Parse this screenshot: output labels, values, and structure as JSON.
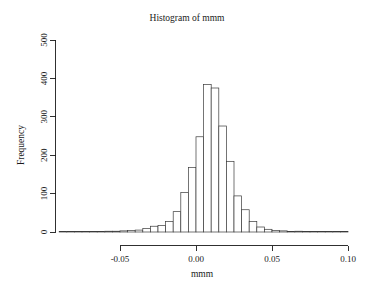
{
  "chart_data": {
    "type": "bar",
    "subtype": "histogram",
    "title": "Histogram of mmm",
    "xlabel": "mmm",
    "ylabel": "Frequency",
    "xlim": [
      -0.09,
      0.101
    ],
    "ylim": [
      0,
      500
    ],
    "grid": false,
    "legend": null,
    "bin_width": 0.005,
    "xticks": [
      -0.05,
      0.0,
      0.05,
      0.1
    ],
    "xticklabels": [
      "-0.05",
      "0.00",
      "0.05",
      "0.10"
    ],
    "yticks": [
      0,
      100,
      200,
      300,
      400,
      500
    ],
    "yticklabels": [
      "0",
      "100",
      "200",
      "300",
      "400",
      "500"
    ],
    "bin_starts": [
      -0.09,
      -0.085,
      -0.08,
      -0.075,
      -0.07,
      -0.065,
      -0.06,
      -0.055,
      -0.05,
      -0.045,
      -0.04,
      -0.035,
      -0.03,
      -0.025,
      -0.02,
      -0.015,
      -0.01,
      -0.005,
      0.0,
      0.005,
      0.01,
      0.015,
      0.02,
      0.025,
      0.03,
      0.035,
      0.04,
      0.045,
      0.05,
      0.055,
      0.06,
      0.065,
      0.07,
      0.075,
      0.08,
      0.085,
      0.09,
      0.095
    ],
    "values": [
      1,
      0,
      0,
      0,
      1,
      1,
      2,
      2,
      3,
      4,
      5,
      9,
      15,
      17,
      27,
      53,
      103,
      168,
      248,
      384,
      375,
      276,
      184,
      94,
      58,
      27,
      13,
      7,
      4,
      3,
      1,
      2,
      1,
      1,
      0,
      0,
      0,
      1
    ],
    "peak_bin": 0.0,
    "peak_value": 484,
    "bar_fill": "#ffffff",
    "bar_stroke": "#3a3a3a",
    "background": "#ffffff",
    "foreground": "#1a1a1a"
  }
}
